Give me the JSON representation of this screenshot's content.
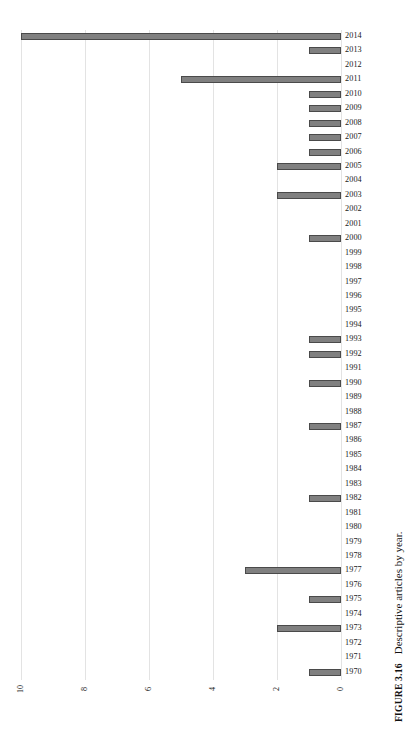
{
  "caption": {
    "label": "FIGURE 3.16",
    "text": "Descriptive articles by year."
  },
  "chart_data": {
    "type": "bar",
    "orientation": "horizontal",
    "title": "",
    "xlabel": "",
    "ylabel": "",
    "xlim": [
      10,
      0
    ],
    "xticks": [
      "10",
      "8",
      "6",
      "4",
      "2",
      "0"
    ],
    "xtick_values": [
      10,
      8,
      6,
      4,
      2,
      0
    ],
    "x_axis_reversed": true,
    "grid": true,
    "legend": "none",
    "bar_color": "#808080",
    "bar_edge_color": "#4a4a4a",
    "gridline_color": "#e3e3e3",
    "categories": [
      "2014",
      "2013",
      "2012",
      "2011",
      "2010",
      "2009",
      "2008",
      "2007",
      "2006",
      "2005",
      "2004",
      "2003",
      "2002",
      "2001",
      "2000",
      "1999",
      "1998",
      "1997",
      "1996",
      "1995",
      "1994",
      "1993",
      "1992",
      "1991",
      "1990",
      "1989",
      "1988",
      "1987",
      "1986",
      "1985",
      "1984",
      "1983",
      "1982",
      "1981",
      "1980",
      "1979",
      "1978",
      "1977",
      "1976",
      "1975",
      "1974",
      "1973",
      "1972",
      "1971",
      "1970"
    ],
    "values": [
      10,
      1,
      0,
      5,
      1,
      1,
      1,
      1,
      1,
      2,
      0,
      2,
      0,
      0,
      1,
      0,
      0,
      0,
      0,
      0,
      0,
      1,
      1,
      0,
      1,
      0,
      0,
      1,
      0,
      0,
      0,
      0,
      1,
      0,
      0,
      0,
      0,
      3,
      0,
      1,
      0,
      2,
      0,
      0,
      1
    ]
  }
}
